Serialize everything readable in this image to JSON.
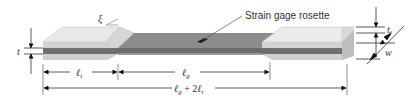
{
  "diagram": {
    "callout": "Strain gage rosette",
    "angle_symbol": "ξ",
    "dimensions": {
      "thickness": "t",
      "tab_thickness_base": "t",
      "tab_thickness_sub": "f",
      "width": "w",
      "tab_length_base": "ℓ",
      "tab_length_sub": "t",
      "gage_length_base": "ℓ",
      "gage_length_sub": "g",
      "total_length_base": "ℓ",
      "total_length_sub": "g",
      "total_length_mid": " + 2",
      "total_length_base2": "ℓ",
      "total_length_sub2": "t"
    },
    "colors": {
      "tab_top": "#e6e6e6",
      "tab_side": "#cfcfcf",
      "tab_bevel": "#d8d8d8",
      "specimen_top": "#8a8a8a",
      "specimen_side": "#6e6e6e",
      "gage": "#1a1a1a",
      "dim_line": "#222222"
    }
  }
}
